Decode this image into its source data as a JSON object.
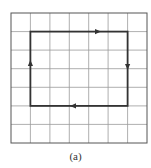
{
  "figure": {
    "caption": "(a)",
    "grid": {
      "columns": 7,
      "rows": 7,
      "line_color": "#999999",
      "border_color": "#444444"
    },
    "loop": {
      "description": "Rectangular closed path on grid traversed clockwise",
      "corners_grid": [
        [
          1,
          1
        ],
        [
          6,
          1
        ],
        [
          6,
          5
        ],
        [
          1,
          5
        ]
      ],
      "direction": "clockwise",
      "arrows": [
        "right on top edge",
        "down on right edge",
        "left on bottom edge",
        "up on left edge"
      ],
      "color": "#333333"
    }
  }
}
